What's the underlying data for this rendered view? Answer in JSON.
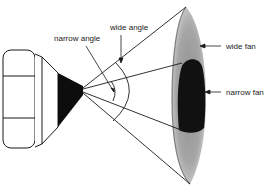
{
  "diagram": {
    "labels": {
      "narrow_angle": "narrow angle",
      "wide_angle": "wide angle",
      "wide_fan": "wide fan",
      "narrow_fan": "narrow fan"
    },
    "colors": {
      "line": "#1a1a1a",
      "wide_fan_fill": "#a8a8a8",
      "narrow_fan_fill": "#111111",
      "background": "#ffffff"
    }
  }
}
